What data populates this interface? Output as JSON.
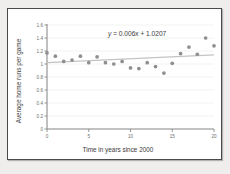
{
  "chart_data": {
    "type": "scatter",
    "title": "",
    "xlabel": "Time in years since 2000",
    "ylabel": "Average home runs per game",
    "xlim": [
      0,
      20
    ],
    "ylim": [
      0,
      1.6
    ],
    "xticks": [
      "0",
      "5",
      "10",
      "15",
      "20"
    ],
    "xtick_values": [
      0,
      5,
      10,
      15,
      20
    ],
    "yticks": [
      "0",
      "0.2",
      "0.4",
      "0.6",
      "0.8",
      "1",
      "1.2",
      "1.4",
      "1.6"
    ],
    "ytick_values": [
      0,
      0.2,
      0.4,
      0.6,
      0.8,
      1,
      1.2,
      1.4,
      1.6
    ],
    "grid": true,
    "legend": "none",
    "x": [
      0,
      1,
      2,
      3,
      4,
      5,
      6,
      7,
      8,
      9,
      10,
      11,
      12,
      13,
      14,
      15,
      16,
      17,
      18,
      19,
      20
    ],
    "values": [
      1.17,
      1.12,
      1.04,
      1.06,
      1.12,
      1.02,
      1.11,
      1.02,
      1.0,
      1.04,
      0.94,
      0.93,
      1.02,
      0.96,
      0.86,
      1.01,
      1.16,
      1.26,
      1.15,
      1.4,
      1.28
    ],
    "point_color": "#8f8f93",
    "trendline": {
      "slope": 0.006,
      "intercept": 1.0207,
      "label": "y = 0.006x + 1.0207",
      "label_y": "y",
      "label_rest": " = 0.006x + 1.0207",
      "color": "#c3c3c3"
    },
    "axis_color": "#8c8c8c",
    "grid_color": "#ebebeb"
  },
  "frame": {
    "background": "#ffffff",
    "border_color": "#4a4a4a",
    "page_background": "#f0eeec"
  }
}
